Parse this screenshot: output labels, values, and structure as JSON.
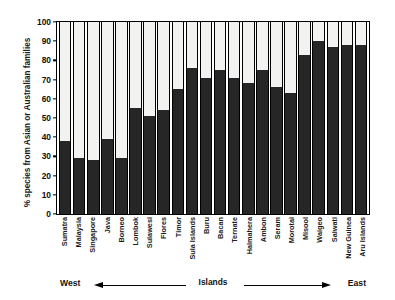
{
  "chart_data": {
    "type": "bar",
    "title": "",
    "xlabel": "Islands",
    "ylabel": "% species from Asian or Australian families",
    "ylim": [
      0,
      100
    ],
    "yticks": [
      0,
      10,
      20,
      30,
      40,
      50,
      60,
      70,
      80,
      90,
      100
    ],
    "grid": false,
    "legend": null,
    "stacked": true,
    "bar_fill_color": "#262626",
    "bar_remainder_color": "#f2f2f0",
    "categories": [
      "Sumatra",
      "Malaysia",
      "Singapore",
      "Java",
      "Borneo",
      "Lombok",
      "Sulawesi",
      "Flores",
      "Timor",
      "Sula Islands",
      "Buru",
      "Bacan",
      "Ternate",
      "Halmahera",
      "Ambon",
      "Seram",
      "Morotai",
      "Misool",
      "Waigeo",
      "Salwati",
      "New Guinea",
      "Aru Islands"
    ],
    "values": [
      38,
      29,
      28,
      39,
      29,
      55,
      51,
      54,
      65,
      76,
      71,
      75,
      71,
      68,
      75,
      66,
      63,
      83,
      90,
      87,
      88,
      88
    ],
    "annotations": {
      "left_direction": "West",
      "right_direction": "East",
      "axis_center": "Islands"
    }
  }
}
